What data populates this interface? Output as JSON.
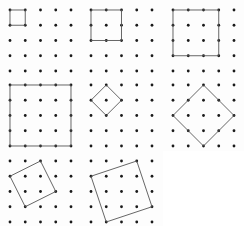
{
  "figure": {
    "title": "",
    "background_color": "#ffffff",
    "panel_background_color": "#fdfdfd",
    "dot_color": "#1a1a1a",
    "line_color": "#555555",
    "rows": 3,
    "cols": 3,
    "lattice": {
      "cols": 5,
      "rows": 5,
      "spacing": 15.25,
      "origin_x": 10,
      "origin_y": 10,
      "dot_radius": 1.4
    }
  },
  "chart_data": {
    "type": "scatter",
    "title": "",
    "xlabel": "",
    "ylabel": "",
    "lattice_points_x": [
      0,
      1,
      2,
      3,
      4
    ],
    "lattice_points_y": [
      0,
      1,
      2,
      3,
      4
    ],
    "panels": [
      {
        "index": 1,
        "name": "square-1x1",
        "side_vector": [
          1,
          0
        ],
        "area": 1,
        "vertices": [
          [
            0,
            0
          ],
          [
            1,
            0
          ],
          [
            1,
            1
          ],
          [
            0,
            1
          ]
        ]
      },
      {
        "index": 2,
        "name": "square-2x2",
        "side_vector": [
          2,
          0
        ],
        "area": 4,
        "vertices": [
          [
            0,
            0
          ],
          [
            2,
            0
          ],
          [
            2,
            2
          ],
          [
            0,
            2
          ]
        ]
      },
      {
        "index": 3,
        "name": "square-3x3",
        "side_vector": [
          3,
          0
        ],
        "area": 9,
        "vertices": [
          [
            0,
            0
          ],
          [
            3,
            0
          ],
          [
            3,
            3
          ],
          [
            0,
            3
          ]
        ]
      },
      {
        "index": 4,
        "name": "square-4x4",
        "side_vector": [
          4,
          0
        ],
        "area": 16,
        "vertices": [
          [
            0,
            0
          ],
          [
            4,
            0
          ],
          [
            4,
            4
          ],
          [
            0,
            4
          ]
        ]
      },
      {
        "index": 5,
        "name": "diamond-small",
        "side_vector": [
          1,
          1
        ],
        "area": 2,
        "vertices": [
          [
            1,
            0
          ],
          [
            2,
            1
          ],
          [
            1,
            2
          ],
          [
            0,
            1
          ]
        ]
      },
      {
        "index": 6,
        "name": "diamond-large",
        "side_vector": [
          2,
          2
        ],
        "area": 8,
        "vertices": [
          [
            2,
            0
          ],
          [
            4,
            2
          ],
          [
            2,
            4
          ],
          [
            0,
            2
          ]
        ]
      },
      {
        "index": 7,
        "name": "tilted-square-1-2",
        "side_vector": [
          1,
          2
        ],
        "area": 5,
        "vertices": [
          [
            2,
            0
          ],
          [
            3,
            2
          ],
          [
            1,
            3
          ],
          [
            0,
            1
          ]
        ]
      },
      {
        "index": 8,
        "name": "tilted-square-1-3",
        "side_vector": [
          1,
          3
        ],
        "area": 10,
        "vertices": [
          [
            3,
            0
          ],
          [
            4,
            3
          ],
          [
            1,
            4
          ],
          [
            0,
            1
          ]
        ]
      },
      {
        "index": 9,
        "name": "blank-panel",
        "side_vector": null,
        "area": null,
        "vertices": []
      }
    ]
  }
}
